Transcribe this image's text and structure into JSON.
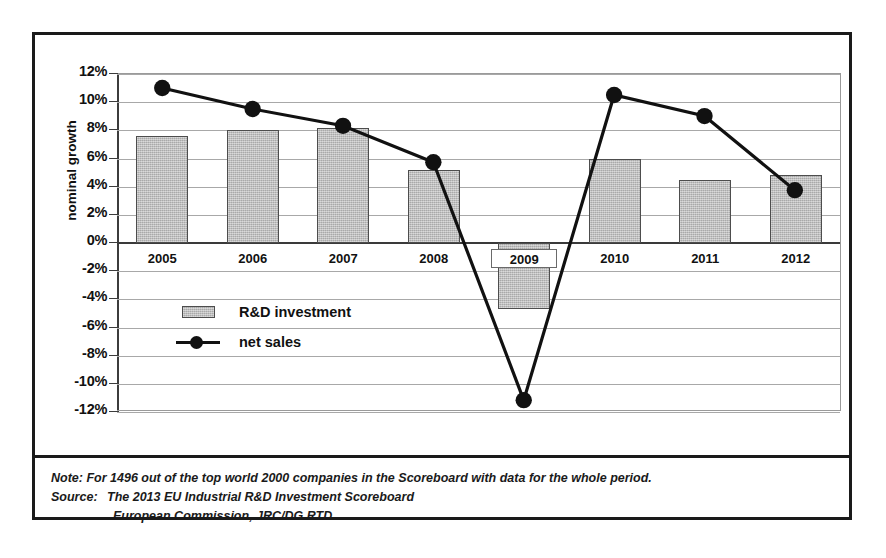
{
  "chart_data": {
    "type": "bar",
    "title": "",
    "subtitle": "",
    "xlabel": "",
    "ylabel": "nominal growth",
    "categories": [
      "2005",
      "2006",
      "2007",
      "2008",
      "2009",
      "2010",
      "2011",
      "2012"
    ],
    "ylim": [
      -12,
      12
    ],
    "ytick_step": 2,
    "ytick_labels": [
      "12%",
      "10%",
      "8%",
      "6%",
      "4%",
      "2%",
      "0%",
      "-2%",
      "-4%",
      "-6%",
      "-8%",
      "-10%",
      "-12%"
    ],
    "ytick_values": [
      12,
      10,
      8,
      6,
      4,
      2,
      0,
      -2,
      -4,
      -6,
      -8,
      -10,
      -12
    ],
    "grid": true,
    "legend_position": "inside-lower-left",
    "series": [
      {
        "name": "R&D investment",
        "type": "bar",
        "color": "#b9b9b9",
        "values": [
          7.6,
          8.0,
          8.2,
          5.2,
          -4.7,
          6.0,
          4.5,
          4.8
        ]
      },
      {
        "name": "net sales",
        "type": "line",
        "color": "#111111",
        "marker": "circle",
        "values": [
          11.0,
          9.5,
          8.3,
          5.7,
          -11.3,
          10.5,
          9.0,
          3.7
        ]
      }
    ]
  },
  "legend": {
    "items": [
      {
        "label": "R&D investment",
        "key": "swatch"
      },
      {
        "label": "net sales",
        "key": "line-marker"
      }
    ]
  },
  "notes": {
    "note_label": "Note:",
    "note_text": "For 1496 out of the top world 2000 companies in the Scoreboard with data for the whole period.",
    "source_label": "Source:",
    "source_line1": "The 2013 EU Industrial R&D Investment Scoreboard",
    "source_line2": "European Commission, JRC/DG RTD."
  }
}
